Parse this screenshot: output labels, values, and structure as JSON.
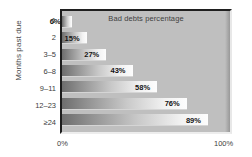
{
  "chart_data": {
    "type": "bar",
    "orientation": "horizontal",
    "title": "Bad debts percentage",
    "xlabel": "",
    "ylabel": "Months past due",
    "categories": [
      "1",
      "2",
      "3–5",
      "6–8",
      "9–11",
      "12–23",
      "≥24"
    ],
    "values": [
      6,
      15,
      27,
      43,
      58,
      76,
      89
    ],
    "value_labels": [
      "6%",
      "15%",
      "27%",
      "43%",
      "58%",
      "76%",
      "89%"
    ],
    "xlim": [
      0,
      100
    ],
    "x_tick_labels": [
      "0%",
      "100%"
    ],
    "grid": false,
    "legend": "none",
    "plot_background": "#bfbfbf",
    "bar_gradient_from": "#6d6d6d",
    "bar_gradient_to": "#fdfdfd",
    "text_color": "#3d3d3d"
  },
  "bars": [
    {
      "category": "1",
      "value": 6,
      "label": "6%"
    },
    {
      "category": "2",
      "value": 15,
      "label": "15%"
    },
    {
      "category": "3–5",
      "value": 27,
      "label": "27%"
    },
    {
      "category": "6–8",
      "value": 43,
      "label": "43%"
    },
    {
      "category": "9–11",
      "value": 58,
      "label": "58%"
    },
    {
      "category": "12–23",
      "value": 76,
      "label": "76%"
    },
    {
      "category": "≥24",
      "value": 89,
      "label": "89%"
    }
  ]
}
